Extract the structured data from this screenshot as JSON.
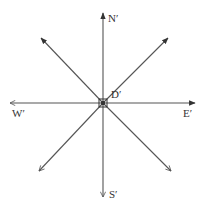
{
  "diagram": {
    "type": "compass-rose",
    "colors": {
      "line": "#555555",
      "text": "#333333",
      "background": "#ffffff"
    },
    "center": {
      "label": "D′",
      "x": 103,
      "y": 103
    },
    "directions": [
      {
        "id": "north",
        "label": "N′",
        "tip": [
          103,
          13
        ],
        "label_pos": [
          108,
          22
        ],
        "head": "filled"
      },
      {
        "id": "south",
        "label": "S′",
        "tip": [
          103,
          197
        ],
        "label_pos": [
          109,
          198
        ],
        "head": "open"
      },
      {
        "id": "west",
        "label": "W′",
        "tip": [
          10,
          103
        ],
        "label_pos": [
          12,
          117
        ],
        "head": "open"
      },
      {
        "id": "east",
        "label": "E′",
        "tip": [
          195,
          103
        ],
        "label_pos": [
          183,
          117
        ],
        "head": "filled"
      },
      {
        "id": "northwest",
        "label": "",
        "tip": [
          41,
          38
        ],
        "head": "filled"
      },
      {
        "id": "northeast",
        "label": "",
        "tip": [
          168,
          38
        ],
        "head": "filled"
      },
      {
        "id": "southwest",
        "label": "",
        "tip": [
          39,
          171
        ],
        "head": "open"
      },
      {
        "id": "southeast",
        "label": "",
        "tip": [
          171,
          171
        ],
        "head": "open"
      }
    ]
  }
}
